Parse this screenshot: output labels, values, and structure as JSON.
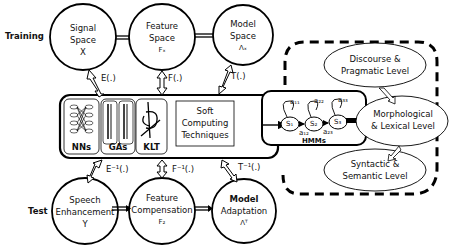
{
  "diagram": {
    "rows": {
      "training_label": "Training",
      "test_label": "Test"
    },
    "training_nodes": [
      {
        "id": "signal-space",
        "line1": "Signal",
        "line2": "Space",
        "symbol": "X"
      },
      {
        "id": "feature-space",
        "line1": "Feature",
        "line2": "Space",
        "symbol": "Fₓ"
      },
      {
        "id": "model-space",
        "line1": "Model",
        "line2": "Space",
        "symbol": "Λₓ"
      }
    ],
    "test_nodes": [
      {
        "id": "speech-enhancement",
        "line1": "Speech",
        "line2": "Enhancement",
        "symbol": "Y"
      },
      {
        "id": "feature-compensation",
        "line1": "Feature",
        "line2": "Compensation",
        "symbol": "F₂"
      },
      {
        "id": "model-adaptation",
        "line1": "Model",
        "line2": "Adaptation",
        "symbol": "Λᵀ"
      }
    ],
    "mappings_up": [
      "E(.)",
      "F(.)",
      "T(.)"
    ],
    "mappings_down": [
      "E⁻¹(.)",
      "F⁻¹(.)",
      "T⁻¹(.)"
    ],
    "soft_computing_box": {
      "modules": [
        "NNs",
        "GAs",
        "KLT"
      ],
      "title_line1": "Soft",
      "title_line2": "Computing",
      "title_line3": "Techniques"
    },
    "hmm_box": {
      "label": "HMMs",
      "states": [
        "S₁",
        "S₂",
        "S₃"
      ],
      "self_transitions": [
        "a₁₁",
        "a₂₂",
        "a₃₃"
      ],
      "forward_transitions": [
        "a₁₂",
        "a₂₃"
      ]
    },
    "language_levels": [
      {
        "id": "discourse",
        "line1": "Discourse &",
        "line2": "Pragmatic Level"
      },
      {
        "id": "morphological",
        "line1": "Morphological",
        "line2": "& Lexical Level"
      },
      {
        "id": "syntactic",
        "line1": "Syntactic &",
        "line2": "Semantic Level"
      }
    ]
  }
}
